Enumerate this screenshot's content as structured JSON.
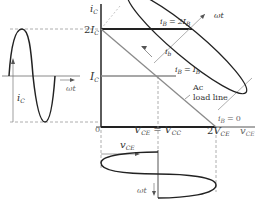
{
  "figure": {
    "type": "transistor-ac-load-line-diagram",
    "colors": {
      "curve": "#222222",
      "axis": "#333333",
      "grey_line": "#8a8a8a",
      "dashed": "#9a9a9a",
      "background": "#ffffff"
    }
  },
  "axes": {
    "y_label_main": "i",
    "y_label_sub": "C",
    "x_label_main": "v",
    "x_label_sub": "CE",
    "origin_label": "0"
  },
  "y_ticks": {
    "two_ic": {
      "prefix": "2",
      "main": "I",
      "sub": "C"
    },
    "ic": {
      "main": "I",
      "sub": "C"
    }
  },
  "x_ticks": {
    "vce_eq": {
      "left_main": "V",
      "left_sub": "CE",
      "eq": "=",
      "right_main": "V",
      "right_sub": "CC"
    },
    "two_vce": {
      "prefix": "2",
      "main": "V",
      "sub": "CE"
    }
  },
  "base_curves": {
    "ib_2IB": {
      "lhs_main": "i",
      "lhs_sub": "B",
      "eq": "=",
      "rhs": "2I",
      "rhs_sub": "B"
    },
    "ib_IB": {
      "lhs_main": "i",
      "lhs_sub": "B",
      "eq": "=",
      "rhs": "I",
      "rhs_sub": "B"
    },
    "ib_0": {
      "lhs_main": "i",
      "lhs_sub": "B",
      "eq": "=",
      "rhs": "0"
    }
  },
  "annotations": {
    "ib_small": {
      "main": "i",
      "sub": "b"
    },
    "omega_t_top": "ωt",
    "omega_t_left": "ωt",
    "omega_t_bottom": "ωt",
    "ac_load_line_1": "Ac",
    "ac_load_line_2": "load line",
    "ic_waveform": {
      "main": "i",
      "sub": "C"
    },
    "vce_waveform": {
      "main": "v",
      "sub": "CE"
    }
  }
}
